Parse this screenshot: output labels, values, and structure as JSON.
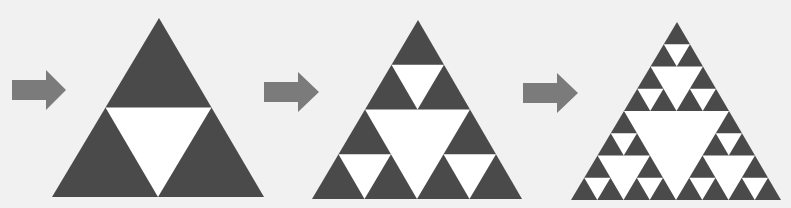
{
  "diagram": {
    "title": "",
    "colors": {
      "background": "#f1f1f1",
      "fill": "#4a4a4a",
      "hole": "#ffffff",
      "arrow": "#7b7b7b"
    },
    "arrows": [
      {
        "shaft_x0": 12,
        "shaft_x1": 46,
        "y_center": 90,
        "shaft_half": 10,
        "head_half": 20,
        "tip_x": 66
      },
      {
        "shaft_x0": 264,
        "shaft_x1": 298,
        "y_center": 92,
        "shaft_half": 10,
        "head_half": 20,
        "tip_x": 319
      },
      {
        "shaft_x0": 523,
        "shaft_x1": 557,
        "y_center": 93,
        "shaft_half": 10,
        "head_half": 20,
        "tip_x": 578
      }
    ],
    "triangles": [
      {
        "name": "iteration-1",
        "apex": [
          159,
          18
        ],
        "base_left": [
          52,
          197
        ],
        "base_right": [
          264,
          197
        ],
        "depth": 1
      },
      {
        "name": "iteration-2",
        "apex": [
          418,
          20
        ],
        "base_left": [
          312,
          199
        ],
        "base_right": [
          522,
          199
        ],
        "depth": 2
      },
      {
        "name": "iteration-3",
        "apex": [
          677,
          22
        ],
        "base_left": [
          571,
          200
        ],
        "base_right": [
          781,
          200
        ],
        "depth": 3
      }
    ]
  }
}
